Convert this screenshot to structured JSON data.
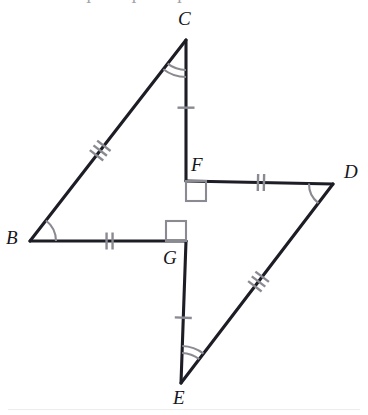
{
  "figure": {
    "background_color": "#ffffff",
    "stroke_color": "#1d1d26",
    "mark_color": "#8a8a92",
    "label_color": "#15151c",
    "width": 368,
    "height": 415,
    "top_clipped_artifact": "I I I"
  },
  "points": {
    "B": {
      "label": "B",
      "x": 30,
      "y": 241,
      "label_x": 6,
      "label_y": 228
    },
    "C": {
      "label": "C",
      "x": 186,
      "y": 40,
      "label_x": 178,
      "label_y": 9
    },
    "D": {
      "label": "D",
      "x": 333,
      "y": 184,
      "label_x": 344,
      "label_y": 162
    },
    "E": {
      "label": "E",
      "x": 181,
      "y": 383,
      "label_x": 173,
      "label_y": 388
    },
    "F": {
      "label": "F",
      "x": 186,
      "y": 181,
      "label_x": 191,
      "label_y": 155
    },
    "G": {
      "label": "G",
      "x": 186,
      "y": 241,
      "label_x": 163,
      "label_y": 248
    }
  },
  "segments": [
    {
      "name": "BC",
      "from": "B",
      "to": "C",
      "ticks": 3,
      "tick_at": 0.45
    },
    {
      "name": "BG",
      "from": "B",
      "to": "G",
      "ticks": 2,
      "tick_at": 0.51
    },
    {
      "name": "CF",
      "from": "C",
      "to": "F",
      "ticks": 1,
      "tick_at": 0.48
    },
    {
      "name": "FD",
      "from": "F",
      "to": "D",
      "ticks": 2,
      "tick_at": 0.51
    },
    {
      "name": "DE",
      "from": "D",
      "to": "E",
      "ticks": 3,
      "tick_at": 0.49
    },
    {
      "name": "GE",
      "from": "G",
      "to": "E",
      "ticks": 1,
      "tick_at": 0.54
    }
  ],
  "angle_marks": [
    {
      "name": "angle-B",
      "vertex": "B",
      "arcs": 1,
      "radius": 26
    },
    {
      "name": "angle-C",
      "vertex": "C",
      "arcs": 2,
      "radius": 30
    },
    {
      "name": "angle-D",
      "vertex": "D",
      "arcs": 1,
      "radius": 24
    },
    {
      "name": "angle-E",
      "vertex": "E",
      "arcs": 2,
      "radius": 30
    }
  ],
  "right_angles": [
    {
      "name": "right-angle-F",
      "vertex": "F",
      "size": 20,
      "dir_x": 1,
      "dir_y": 1
    },
    {
      "name": "right-angle-G",
      "vertex": "G",
      "size": 20,
      "dir_x": -1,
      "dir_y": -1
    }
  ]
}
